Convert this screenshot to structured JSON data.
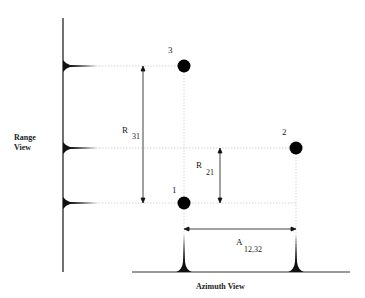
{
  "diagram": {
    "range_view_label_line1": "Range",
    "range_view_label_line2": "View",
    "azimuth_view_label": "Azimuth View",
    "points": [
      {
        "id": "1",
        "label": "1"
      },
      {
        "id": "2",
        "label": "2"
      },
      {
        "id": "3",
        "label": "3"
      }
    ],
    "measurements": {
      "r31": {
        "symbol": "R",
        "subscript": "31"
      },
      "r21": {
        "symbol": "R",
        "subscript": "21"
      },
      "a1232": {
        "symbol": "A",
        "subscript": "12,32"
      }
    }
  }
}
